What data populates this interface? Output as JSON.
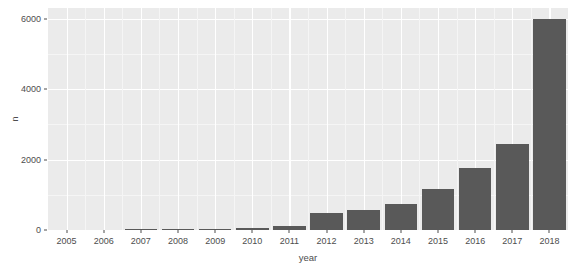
{
  "chart_data": {
    "type": "bar",
    "title": "",
    "xlabel": "year",
    "ylabel": "n",
    "categories": [
      "2005",
      "2006",
      "2007",
      "2008",
      "2009",
      "2010",
      "2011",
      "2012",
      "2013",
      "2014",
      "2015",
      "2016",
      "2017",
      "2018"
    ],
    "values": [
      0,
      0,
      5,
      30,
      40,
      60,
      110,
      480,
      560,
      740,
      1150,
      1750,
      2450,
      6000
    ],
    "ylim": [
      0,
      6300
    ],
    "y_ticks": [
      0,
      2000,
      4000,
      6000
    ],
    "y_tick_labels": [
      "0",
      "2000",
      "4000",
      "6000"
    ],
    "y_minor_ticks": [
      1000,
      3000,
      5000
    ],
    "grid": true,
    "legend": "none",
    "bar_color": "#595959",
    "panel_color": "#ebebeb",
    "gridline_color": "#ffffff",
    "axis_text_color": "#4d4d4d"
  }
}
